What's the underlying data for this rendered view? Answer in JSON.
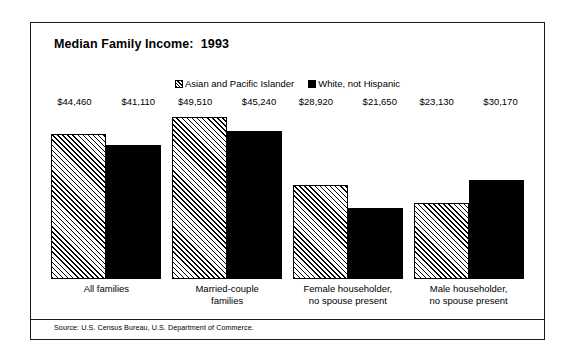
{
  "title": "Median Family Income:  1993",
  "source": "Source:  U.S. Census Bureau, U.S. Department of Commerce.",
  "legend": {
    "items": [
      {
        "label": "Asian and Pacific Islander",
        "swatch": "hatched-square-icon"
      },
      {
        "label": "White, not Hispanic",
        "swatch": "filled-square-icon"
      }
    ]
  },
  "categories": [
    {
      "line1": "All families",
      "line2": ""
    },
    {
      "line1": "Married-couple",
      "line2": "families"
    },
    {
      "line1": "Female householder,",
      "line2": "no spouse present"
    },
    {
      "line1": "Male householder,",
      "line2": "no spouse present"
    }
  ],
  "bars": [
    {
      "value_label": "$44,460",
      "value": 44460,
      "series": "Asian and Pacific Islander"
    },
    {
      "value_label": "$41,110",
      "value": 41110,
      "series": "White, not Hispanic"
    },
    {
      "value_label": "$49,510",
      "value": 49510,
      "series": "Asian and Pacific Islander"
    },
    {
      "value_label": "$45,240",
      "value": 45240,
      "series": "White, not Hispanic"
    },
    {
      "value_label": "$28,920",
      "value": 28920,
      "series": "Asian and Pacific Islander"
    },
    {
      "value_label": "$21,650",
      "value": 21650,
      "series": "White, not Hispanic"
    },
    {
      "value_label": "$23,130",
      "value": 23130,
      "series": "Asian and Pacific Islander"
    },
    {
      "value_label": "$30,170",
      "value": 30170,
      "series": "White, not Hispanic"
    }
  ],
  "chart_data": {
    "type": "bar",
    "title": "Median Family Income:  1993",
    "subtitle": "",
    "xlabel": "",
    "ylabel": "",
    "grid": false,
    "legend_position": "top-center",
    "axis_visible": false,
    "ylim": [
      0,
      52000
    ],
    "categories": [
      "All families",
      "Married-couple families",
      "Female householder, no spouse present",
      "Male householder, no spouse present"
    ],
    "series": [
      {
        "name": "Asian and Pacific Islander",
        "fill": "diagonal-hatch",
        "values": [
          44460,
          49510,
          28920,
          23130
        ],
        "data_labels": [
          "$44,460",
          "$49,510",
          "$28,920",
          "$23,130"
        ]
      },
      {
        "name": "White, not Hispanic",
        "fill": "solid-black",
        "values": [
          41110,
          45240,
          21650,
          30170
        ],
        "data_labels": [
          "$41,110",
          "$45,240",
          "$21,650",
          "$30,170"
        ]
      }
    ],
    "annotations": [
      "Source:  U.S. Census Bureau, U.S. Department of Commerce."
    ]
  },
  "colors": {
    "ink": "#000000",
    "background": "#ffffff",
    "frame": "#1a1a1a"
  }
}
